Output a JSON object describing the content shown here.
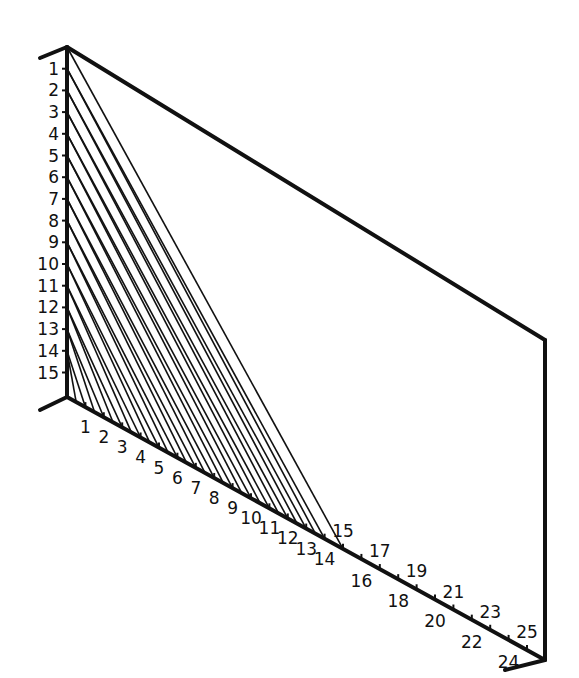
{
  "diagram": {
    "type": "string-art-parabolic-curve",
    "colors": {
      "ink": "#111111",
      "background": "#ffffff"
    },
    "vertical_axis": {
      "labels": [
        "1",
        "2",
        "3",
        "4",
        "5",
        "6",
        "7",
        "8",
        "9",
        "10",
        "11",
        "12",
        "13",
        "14",
        "15"
      ],
      "x": 67,
      "y_top": 47,
      "y_bottom": 397,
      "spacing": 21.7
    },
    "bottom_axis": {
      "labels": [
        "1",
        "2",
        "3",
        "4",
        "5",
        "6",
        "7",
        "8",
        "9",
        "10",
        "11",
        "12",
        "13",
        "14",
        "15",
        "16",
        "17",
        "18",
        "19",
        "20",
        "21",
        "22",
        "23",
        "24",
        "25"
      ],
      "start": [
        67,
        397
      ],
      "end": [
        545,
        660
      ],
      "dx": 18.4,
      "slope": 0.55
    },
    "frame": {
      "top_edge": [
        [
          67,
          47
        ],
        [
          545,
          340
        ]
      ],
      "right_edge": [
        [
          545,
          340
        ],
        [
          545,
          660
        ]
      ],
      "top_stub": [
        [
          40,
          58
        ],
        [
          67,
          47
        ]
      ],
      "bottom_left_stub": [
        [
          40,
          410
        ],
        [
          67,
          397
        ]
      ],
      "bottom_right_stub": [
        [
          505,
          670
        ],
        [
          545,
          660
        ]
      ]
    },
    "threads": "vertical point k connected to bottom point (15 - k)"
  }
}
